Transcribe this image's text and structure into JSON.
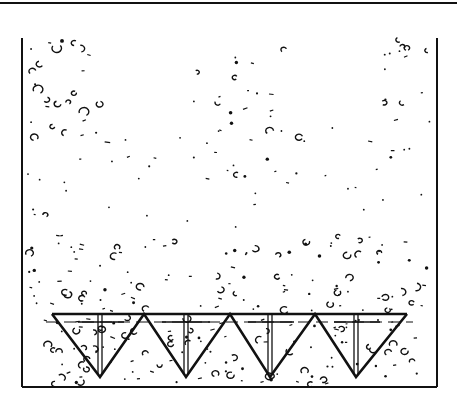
{
  "figure": {
    "width": 457,
    "height": 393,
    "stroke_color": "#111111",
    "background_color": "#ffffff"
  },
  "frame": {
    "top_rule": {
      "x1": 0,
      "y1": 3,
      "x2": 457,
      "y2": 3,
      "width": 2
    },
    "left_wall": {
      "x": 22,
      "y1": 38,
      "y2": 387
    },
    "right_wall": {
      "x": 437,
      "y1": 38,
      "y2": 387
    },
    "bottom": {
      "y": 387,
      "x1": 22,
      "x2": 437
    }
  },
  "plate": {
    "top_bar": {
      "y": 314,
      "x1": 52,
      "x2": 407
    },
    "dashed_line": {
      "y": 322,
      "x1": 46,
      "x2": 413
    },
    "zigzag_points": [
      [
        52,
        314
      ],
      [
        100,
        377
      ],
      [
        144,
        314
      ],
      [
        186,
        377
      ],
      [
        230,
        314
      ],
      [
        270,
        377
      ],
      [
        315,
        314
      ],
      [
        356,
        377
      ],
      [
        407,
        314
      ]
    ],
    "stakes": [
      {
        "x": 100,
        "y1": 315,
        "y2": 374
      },
      {
        "x": 186,
        "y1": 315,
        "y2": 374
      },
      {
        "x": 270,
        "y1": 315,
        "y2": 374
      },
      {
        "x": 356,
        "y1": 315,
        "y2": 374
      }
    ],
    "crossbars": [
      {
        "x1": 78,
        "x2": 124,
        "y": 322
      },
      {
        "x1": 162,
        "x2": 210,
        "y": 322
      },
      {
        "x1": 248,
        "x2": 294,
        "y": 322
      },
      {
        "x1": 334,
        "x2": 380,
        "y": 322
      }
    ]
  },
  "particles": {
    "seed": 7,
    "clusters": [
      {
        "name": "upper-left",
        "x": [
          28,
          110
        ],
        "y": [
          40,
          150
        ],
        "count": 26,
        "size": [
          2,
          5
        ]
      },
      {
        "name": "upper-middle-band",
        "x": [
          190,
          300
        ],
        "y": [
          45,
          190
        ],
        "count": 30,
        "size": [
          1.5,
          4
        ]
      },
      {
        "name": "upper-right",
        "x": [
          370,
          430
        ],
        "y": [
          40,
          160
        ],
        "count": 18,
        "size": [
          1.5,
          3.5
        ]
      },
      {
        "name": "sparse-middle",
        "x": [
          28,
          430
        ],
        "y": [
          120,
          240
        ],
        "count": 40,
        "size": [
          1,
          2.5
        ]
      },
      {
        "name": "dense-lower",
        "x": [
          28,
          430
        ],
        "y": [
          235,
          312
        ],
        "count": 110,
        "size": [
          1.5,
          4
        ]
      },
      {
        "name": "inside-plate",
        "x": [
          40,
          420
        ],
        "y": [
          318,
          385
        ],
        "count": 120,
        "size": [
          1.5,
          4
        ]
      }
    ]
  }
}
